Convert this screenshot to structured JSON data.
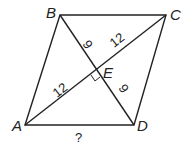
{
  "figure": {
    "vertices": {
      "A": "A",
      "B": "B",
      "C": "C",
      "D": "D",
      "E": "E"
    },
    "segment_labels": {
      "BE": "9",
      "EC": "12",
      "AE": "12",
      "ED": "9",
      "AD": "?"
    },
    "right_angle_at": "E"
  }
}
